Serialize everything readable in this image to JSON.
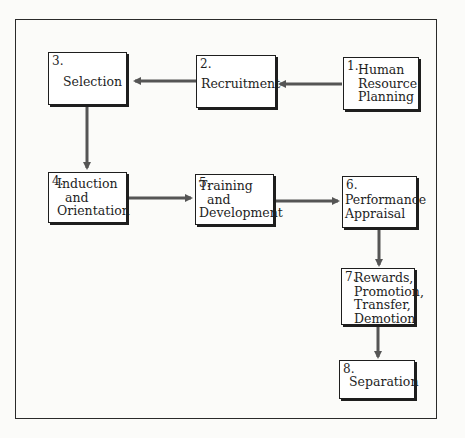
{
  "diagram": {
    "type": "flowchart",
    "steps": [
      {
        "id": 1,
        "number": "1.",
        "label": "Human\nResource\nPlanning"
      },
      {
        "id": 2,
        "number": "2.",
        "label": "Recruitment"
      },
      {
        "id": 3,
        "number": "3.",
        "label": "Selection"
      },
      {
        "id": 4,
        "number": "4.",
        "label": "Induction\n  and\nOrientation"
      },
      {
        "id": 5,
        "number": "5.",
        "label": "Training\n  and\nDevelopment"
      },
      {
        "id": 6,
        "number": "6.",
        "label": "Performance\nAppraisal"
      },
      {
        "id": 7,
        "number": "7.",
        "label": "Rewards,\nPromotion,\nTransfer,\nDemotion"
      },
      {
        "id": 8,
        "number": "8.",
        "label": "Separation"
      }
    ],
    "edges": [
      {
        "from": 1,
        "to": 2
      },
      {
        "from": 2,
        "to": 3
      },
      {
        "from": 3,
        "to": 4
      },
      {
        "from": 4,
        "to": 5
      },
      {
        "from": 5,
        "to": 6
      },
      {
        "from": 6,
        "to": 7
      },
      {
        "from": 7,
        "to": 8
      }
    ],
    "colors": {
      "line": "#555555",
      "box_border": "#1e1e1e",
      "background": "#fbfbf9"
    }
  }
}
